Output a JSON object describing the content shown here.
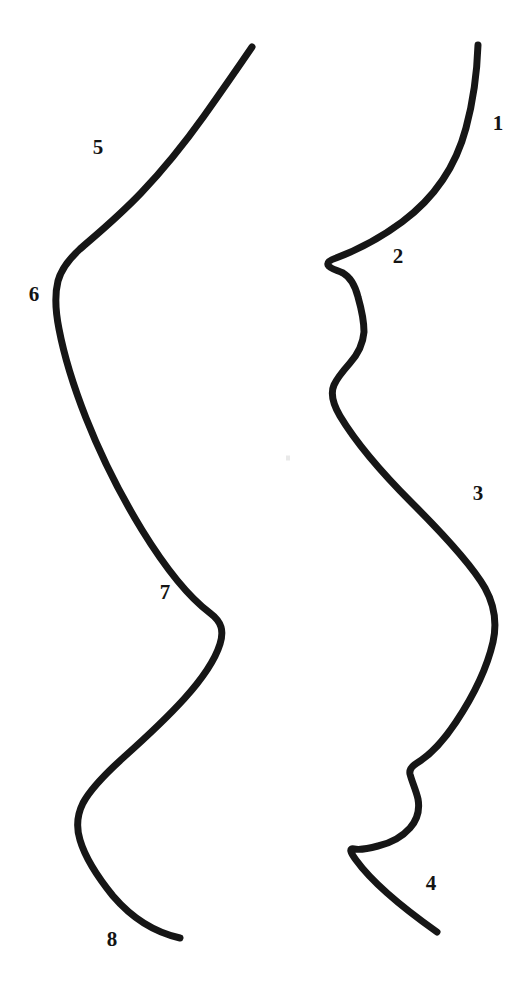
{
  "figure": {
    "background_color": "#ffffff",
    "stroke_color": "#161616",
    "label_color": "#141414",
    "width": 530,
    "height": 991,
    "caption": "",
    "caption_top": 978,
    "artifact": {
      "x": 288,
      "y": 458
    },
    "curves": [
      {
        "name": "right-profile-curve",
        "side": "right",
        "stroke_width": 7,
        "path": "M 478 45 C 477 74, 473 102, 466 128 C 457 162, 437 196, 402 222 C 375 242, 352 252, 336 258 C 330 260, 327 262, 328 265 C 330 269, 337 270, 343 273 C 350 277, 355 285, 358 297 C 362 311, 364 322, 364 332 C 363 344, 358 354, 350 363 C 343 371, 337 378, 334 385 C 330 394, 333 404, 340 416 C 352 436, 375 466, 412 503 C 448 539, 473 567, 485 588 C 495 606, 497 624, 493 642 C 487 668, 474 695, 456 722 C 442 743, 427 757, 417 763 C 412 766, 409 769, 410 774 C 412 782, 416 790, 418 799 C 420 810, 417 820, 410 828 C 402 837, 391 843, 378 846 C 367 849, 359 850, 354 849 C 349 848, 350 852, 356 860 C 369 878, 396 903, 437 932"
      },
      {
        "name": "left-profile-curve",
        "side": "left",
        "stroke_width": 7,
        "path": "M 252 47 C 237 69, 221 92, 204 116 C 184 144, 163 170, 141 193 C 117 218, 96 235, 80 249 C 68 260, 61 270, 58 281 C 55 293, 55 309, 59 329 C 64 355, 73 385, 86 418 C 101 456, 120 494, 142 530 C 166 569, 190 598, 210 613 C 222 622, 224 631, 220 644 C 215 660, 203 678, 184 699 C 164 721, 143 740, 124 757 C 104 775, 90 790, 83 803 C 77 815, 76 827, 80 840 C 85 857, 96 875, 113 896 C 131 917, 153 932, 180 938"
      }
    ],
    "labels": [
      {
        "id": "label-1",
        "text": "1",
        "x": 498,
        "y": 123
      },
      {
        "id": "label-2",
        "text": "2",
        "x": 398,
        "y": 256
      },
      {
        "id": "label-3",
        "text": "3",
        "x": 478,
        "y": 493
      },
      {
        "id": "label-4",
        "text": "4",
        "x": 431,
        "y": 883
      },
      {
        "id": "label-5",
        "text": "5",
        "x": 98,
        "y": 147
      },
      {
        "id": "label-6",
        "text": "6",
        "x": 34,
        "y": 294
      },
      {
        "id": "label-7",
        "text": "7",
        "x": 165,
        "y": 592
      },
      {
        "id": "label-8",
        "text": "8",
        "x": 112,
        "y": 939
      }
    ]
  }
}
